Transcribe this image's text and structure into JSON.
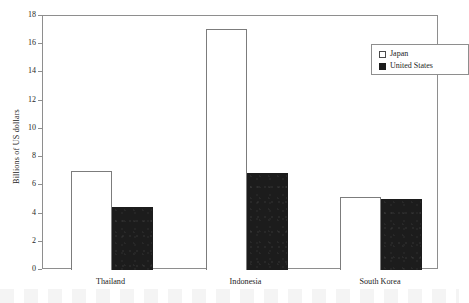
{
  "chart_data": {
    "type": "bar",
    "title": "",
    "xlabel": "",
    "ylabel": "Billions of US dollars",
    "categories": [
      "Thailand",
      "Indonesia",
      "South Korea"
    ],
    "series": [
      {
        "name": "Japan",
        "values": [
          7.0,
          17.1,
          5.2
        ],
        "style": "open",
        "color": "#ffffff",
        "edge_color": "#7c7c7c"
      },
      {
        "name": "United States",
        "values": [
          4.5,
          6.9,
          5.0
        ],
        "style": "filled",
        "color": "#1c1c1c",
        "edge_color": "#1c1c1c"
      }
    ],
    "ylim": [
      0,
      18
    ],
    "yticks": [
      0,
      2,
      4,
      6,
      8,
      10,
      12,
      14,
      16,
      18
    ],
    "ytick_labels": [
      "0",
      "2",
      "4",
      "6",
      "8",
      "10",
      "12",
      "14",
      "16",
      "18"
    ],
    "grid": false,
    "legend_position": "top-right-inside",
    "frame": "box"
  },
  "legend": {
    "entries": [
      {
        "label": "Japan",
        "swatch": "open-square"
      },
      {
        "label": "United States",
        "swatch": "filled-square"
      }
    ]
  },
  "axes": {
    "y_title": "Billions of US dollars"
  }
}
